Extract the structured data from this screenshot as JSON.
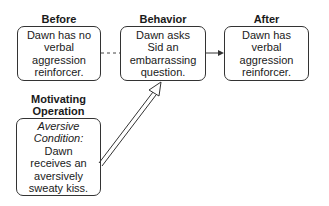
{
  "diagram": {
    "nodes": {
      "before": {
        "title": "Before",
        "lines": [
          "Dawn has no",
          "verbal",
          "aggression",
          "reinforcer."
        ]
      },
      "behavior": {
        "title": "Behavior",
        "lines": [
          "Dawn asks",
          "Sid an",
          "embarrassing",
          "question."
        ]
      },
      "after": {
        "title": "After",
        "lines": [
          "Dawn has",
          "verbal",
          "aggression",
          "reinforcer."
        ]
      },
      "motivating_operation": {
        "title_lines": [
          "Motivating",
          "Operation"
        ],
        "italic_lines": [
          "Aversive",
          "Condition:"
        ],
        "lines": [
          "Dawn",
          "receives an",
          "aversively",
          "sweaty kiss."
        ]
      }
    },
    "edges": [
      {
        "from": "before",
        "to": "behavior",
        "style": "dashed"
      },
      {
        "from": "behavior",
        "to": "after",
        "style": "solid-arrow"
      },
      {
        "from": "motivating_operation",
        "to": "behavior",
        "style": "double-line-arrow"
      }
    ]
  }
}
